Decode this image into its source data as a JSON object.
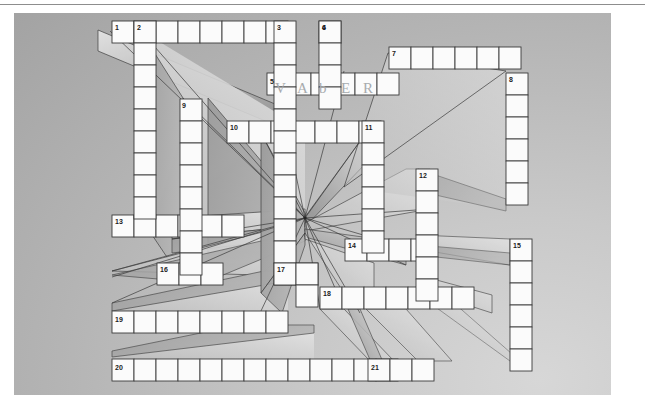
{
  "page": {
    "background_color": "#ffffff",
    "panel_color_light": "#d7d7d7",
    "panel_color_dark": "#9f9f9f",
    "cell_fill": "#fbfbfb",
    "cell_stroke": "#3b3b3b",
    "extrude_light": "#dcdcdc",
    "extrude_dark": "#8c8c8c"
  },
  "grid": {
    "cell_size": 22,
    "origin_x": 112,
    "origin_y": 21,
    "vanishing_point": {
      "x": 305,
      "y": 218
    }
  },
  "clue_numbers": [
    {
      "n": "1",
      "x": 115,
      "y": 24
    },
    {
      "n": "2",
      "x": 137,
      "y": 24
    },
    {
      "n": "3",
      "x": 277,
      "y": 24
    },
    {
      "n": "4",
      "x": 322,
      "y": 24
    },
    {
      "n": "5",
      "x": 270,
      "y": 78
    },
    {
      "n": "6",
      "x": 322,
      "y": 24
    },
    {
      "n": "7",
      "x": 392,
      "y": 50
    },
    {
      "n": "8",
      "x": 509,
      "y": 76
    },
    {
      "n": "9",
      "x": 182,
      "y": 102
    },
    {
      "n": "10",
      "x": 230,
      "y": 124
    },
    {
      "n": "11",
      "x": 365,
      "y": 124
    },
    {
      "n": "12",
      "x": 419,
      "y": 172
    },
    {
      "n": "13",
      "x": 115,
      "y": 218
    },
    {
      "n": "14",
      "x": 348,
      "y": 242
    },
    {
      "n": "15",
      "x": 513,
      "y": 242
    },
    {
      "n": "16",
      "x": 160,
      "y": 266
    },
    {
      "n": "17",
      "x": 277,
      "y": 266
    },
    {
      "n": "18",
      "x": 323,
      "y": 290
    },
    {
      "n": "19",
      "x": 115,
      "y": 316
    },
    {
      "n": "20",
      "x": 115,
      "y": 364
    },
    {
      "n": "21",
      "x": 371,
      "y": 364
    }
  ],
  "filled_answer": {
    "label": "handwritten entry at clue 5",
    "letters": [
      "V",
      "A",
      "b",
      "E",
      "R"
    ],
    "start_x": 271,
    "start_y": 77,
    "cell_size": 22
  },
  "rows": [
    {
      "id": "row-1",
      "start_x": 112,
      "y": 21,
      "cells": 8,
      "label": "1 across"
    },
    {
      "id": "row-1b",
      "start_x": 319,
      "y": 21,
      "cells": 1,
      "label": "6 down head"
    },
    {
      "id": "row-7",
      "start_x": 389,
      "y": 47,
      "cells": 6,
      "label": "7 across"
    },
    {
      "id": "row-5",
      "start_x": 267,
      "y": 73,
      "cells": 6,
      "label": "5 across"
    },
    {
      "id": "row-10",
      "start_x": 227,
      "y": 121,
      "cells": 7,
      "label": "10 across"
    },
    {
      "id": "row-13",
      "start_x": 112,
      "y": 215,
      "cells": 6,
      "label": "13 across"
    },
    {
      "id": "row-14",
      "start_x": 345,
      "y": 239,
      "cells": 4,
      "label": "14 across"
    },
    {
      "id": "row-16",
      "start_x": 157,
      "y": 263,
      "cells": 3,
      "label": "16 across"
    },
    {
      "id": "row-17",
      "start_x": 274,
      "y": 263,
      "cells": 2,
      "label": "17 across"
    },
    {
      "id": "row-18",
      "start_x": 320,
      "y": 287,
      "cells": 7,
      "label": "18 across"
    },
    {
      "id": "row-19",
      "start_x": 112,
      "y": 311,
      "cells": 8,
      "label": "19 across"
    },
    {
      "id": "row-20",
      "start_x": 112,
      "y": 359,
      "cells": 13,
      "label": "20 across"
    },
    {
      "id": "row-21",
      "start_x": 368,
      "y": 359,
      "cells": 3,
      "label": "21 across"
    }
  ],
  "columns": [
    {
      "id": "col-2",
      "x": 134,
      "start_y": 21,
      "cells": 9,
      "label": "2 down"
    },
    {
      "id": "col-3",
      "x": 274,
      "start_y": 21,
      "cells": 12,
      "label": "3 down"
    },
    {
      "id": "col-6",
      "x": 319,
      "start_y": 21,
      "cells": 4,
      "label": "6 down"
    },
    {
      "id": "col-8",
      "x": 506,
      "start_y": 73,
      "cells": 6,
      "label": "8 down"
    },
    {
      "id": "col-9",
      "x": 180,
      "start_y": 99,
      "cells": 8,
      "label": "9 down"
    },
    {
      "id": "col-11",
      "x": 362,
      "start_y": 121,
      "cells": 6,
      "label": "11 down"
    },
    {
      "id": "col-12",
      "x": 416,
      "start_y": 169,
      "cells": 6,
      "label": "12 down"
    },
    {
      "id": "col-15",
      "x": 510,
      "start_y": 239,
      "cells": 6,
      "label": "15 down"
    },
    {
      "id": "col-17",
      "x": 296,
      "start_y": 263,
      "cells": 2,
      "label": "17 down"
    }
  ]
}
